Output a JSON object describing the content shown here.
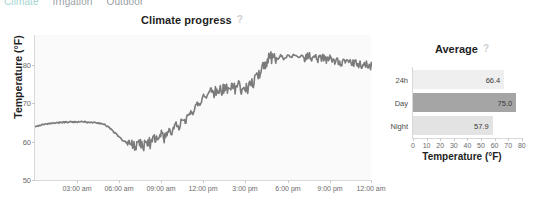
{
  "tabs": [
    {
      "label": "Climate",
      "active": true
    },
    {
      "label": "Irrigation",
      "active": false
    },
    {
      "label": "Outdoor",
      "active": false
    }
  ],
  "help_icon": "?",
  "line_chart": {
    "title": "Climate progress",
    "ylabel": "Temperature (°F)",
    "yticks": [
      "50",
      "60",
      "70",
      "80"
    ],
    "xticks": [
      "03:00 am",
      "06:00 am",
      "09:00 am",
      "12:00 pm",
      "3:00 pm",
      "6:00 pm",
      "9:00 pm",
      "12:00 am"
    ],
    "line_color": "#7b7b7b"
  },
  "bar_chart": {
    "title": "Average",
    "xlabel": "Temperature (°F)",
    "xticks": [
      "0",
      "10",
      "20",
      "30",
      "40",
      "50",
      "60",
      "70",
      "80"
    ]
  },
  "chart_data": [
    {
      "type": "line",
      "title": "Climate progress",
      "xlabel": "",
      "ylabel": "Temperature (°F)",
      "ylim": [
        46,
        84
      ],
      "yticks": [
        50,
        60,
        70,
        80
      ],
      "xlim": [
        0,
        24
      ],
      "xtick_labels": [
        "03:00 am",
        "06:00 am",
        "09:00 am",
        "12:00 pm",
        "3:00 pm",
        "6:00 pm",
        "9:00 pm",
        "12:00 am"
      ],
      "xtick_values": [
        3,
        6,
        9,
        12,
        15,
        18,
        21,
        24
      ],
      "grid": false,
      "legend": null,
      "series": [
        {
          "name": "Temperature",
          "color": "#7b7b7b",
          "x": [
            0.0,
            0.25,
            0.5,
            0.75,
            1.0,
            1.25,
            1.5,
            1.75,
            2.0,
            2.25,
            2.5,
            2.75,
            3.0,
            3.25,
            3.5,
            3.75,
            4.0,
            4.25,
            4.5,
            4.75,
            5.0,
            5.25,
            5.5,
            5.75,
            6.0,
            6.25,
            6.5,
            6.75,
            7.0,
            7.25,
            7.5,
            7.75,
            8.0,
            8.25,
            8.5,
            8.75,
            9.0,
            9.25,
            9.5,
            9.75,
            10.0,
            10.25,
            10.5,
            10.75,
            11.0,
            11.25,
            11.5,
            11.75,
            12.0,
            12.25,
            12.5,
            12.75,
            13.0,
            13.25,
            13.5,
            13.75,
            14.0,
            14.25,
            14.5,
            14.75,
            15.0,
            15.25,
            15.5,
            15.75,
            16.0,
            16.25,
            16.5,
            16.75,
            17.0,
            17.25,
            17.5,
            17.75,
            18.0,
            18.25,
            18.5,
            18.75,
            19.0,
            19.25,
            19.5,
            19.75,
            20.0,
            20.25,
            20.5,
            20.75,
            21.0,
            21.25,
            21.5,
            21.75,
            22.0,
            22.25,
            22.5,
            22.75,
            23.0,
            23.25,
            23.5,
            23.75,
            24.0
          ],
          "y": [
            60.3,
            60.4,
            60.6,
            60.7,
            60.9,
            61.0,
            61.1,
            61.2,
            61.3,
            61.3,
            61.4,
            61.4,
            61.3,
            61.4,
            61.4,
            61.3,
            61.2,
            61.2,
            61.1,
            60.9,
            60.6,
            60.0,
            59.2,
            58.3,
            57.4,
            56.6,
            56.0,
            55.6,
            55.4,
            55.3,
            55.8,
            55.2,
            56.4,
            55.6,
            57.2,
            56.1,
            58.2,
            57.0,
            59.4,
            58.3,
            60.8,
            59.8,
            62.4,
            61.5,
            64.3,
            63.4,
            66.3,
            65.6,
            68.4,
            67.9,
            69.9,
            69.2,
            70.1,
            69.6,
            70.4,
            69.8,
            70.6,
            70.0,
            70.5,
            69.9,
            70.3,
            70.4,
            71.5,
            72.8,
            74.4,
            75.9,
            77.2,
            78.0,
            78.4,
            77.6,
            78.6,
            77.8,
            78.8,
            78.0,
            78.9,
            78.1,
            78.7,
            77.9,
            78.5,
            77.8,
            78.3,
            77.6,
            78.1,
            77.4,
            77.8,
            77.2,
            77.5,
            76.9,
            77.2,
            76.6,
            76.9,
            76.4,
            76.6,
            76.1,
            76.3,
            75.9,
            76.0
          ],
          "noise": true
        }
      ]
    },
    {
      "type": "bar",
      "orientation": "horizontal",
      "title": "Average",
      "xlabel": "Temperature (°F)",
      "ylabel": "",
      "xlim": [
        0,
        80
      ],
      "xticks": [
        0,
        10,
        20,
        30,
        40,
        50,
        60,
        70,
        80
      ],
      "grid": false,
      "categories": [
        "24h",
        "Day",
        "Night"
      ],
      "values": [
        66.4,
        75.0,
        57.9
      ],
      "value_labels": [
        "66.4",
        "75.0",
        "57.9"
      ],
      "colors": [
        "#efefef",
        "#a5a5a5",
        "#e3e3e3"
      ]
    }
  ]
}
